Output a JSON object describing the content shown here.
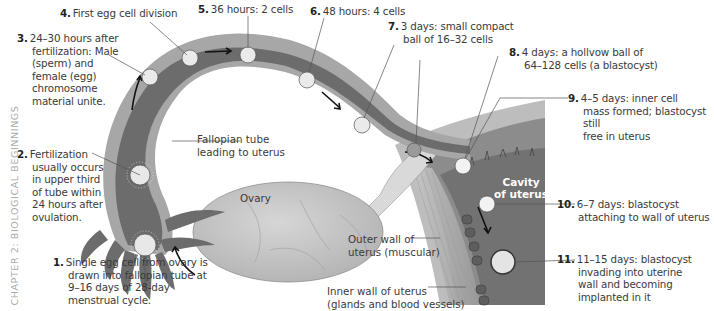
{
  "side_caption": "CHAPTER 2: BIOLOGICAL BEGINNINGS",
  "steps": [
    {
      "num": "1.",
      "text": "Single egg cell from ovary is drawn into fallopian tube at 9–16 days of 28-day menstrual cycle.",
      "lines": [
        "Single egg cell from ovary is",
        "drawn into fallopian tube at",
        "9–16 days of 28-day",
        "menstrual cycle."
      ]
    },
    {
      "num": "2.",
      "text": "Fertilization usually occurs in upper third of tube within 24 hours after ovulation.",
      "lines": [
        "Fertilization",
        "usually occurs",
        "in upper third",
        "of tube within",
        "24 hours after",
        "ovulation."
      ]
    },
    {
      "num": "3.",
      "text": "24–30 hours after fertilization: Male (sperm) and female (egg) chromosome material unite.",
      "lines": [
        "24–30 hours after",
        "fertilization: Male",
        "(sperm) and",
        "female (egg)",
        "chromosome",
        "material unite."
      ]
    },
    {
      "num": "4.",
      "text": "First egg cell division"
    },
    {
      "num": "5.",
      "text": "36 hours: 2 cells"
    },
    {
      "num": "6.",
      "text": "48 hours: 4 cells"
    },
    {
      "num": "7.",
      "text": "3 days: small compact ball of 16–32 cells",
      "lines": [
        "3 days: small compact",
        "ball of 16–32 cells"
      ]
    },
    {
      "num": "8.",
      "text": "4 days: a hollvow ball of 64–128 cells (a blastocyst)",
      "lines": [
        "4 days: a hollvow ball of",
        "64–128 cells (a blastocyst)"
      ]
    },
    {
      "num": "9.",
      "text": "4–5 days: inner cell mass formed; blastocyst still free in uterus",
      "lines": [
        "4–5 days: inner cell",
        "mass formed; blastocyst still",
        "free in uterus"
      ]
    },
    {
      "num": "10.",
      "text": "6–7 days: blastocyst attaching to wall of uterus",
      "lines": [
        "6–7 days: blastocyst",
        "attaching to wall of uterus"
      ]
    },
    {
      "num": "11.",
      "text": "11–15 days: blastocyst invading into uterine wall and becoming implanted in it",
      "lines": [
        "11–15 days: blastocyst",
        "invading into uterine",
        "wall and becoming",
        "implanted in it"
      ]
    }
  ],
  "labels": {
    "fallopian": [
      "Fallopian tube",
      "leading to uterus"
    ],
    "ovary": "Ovary",
    "cavity": [
      "Cavity",
      "of uterus"
    ],
    "outer_wall": [
      "Outer wall of",
      "uterus (muscular)"
    ],
    "inner_wall": [
      "Inner wall of uterus",
      "(glands and blood vessels)"
    ]
  },
  "colors": {
    "tube_outer": "#a9a9a9",
    "tube_inner": "#6e6e6e",
    "uterus_cavity": "#707070",
    "uterus_wall": "#b8b8b8",
    "ovary": "#c4c4c4",
    "text": "#3a3a3a",
    "background": "#ffffff"
  }
}
